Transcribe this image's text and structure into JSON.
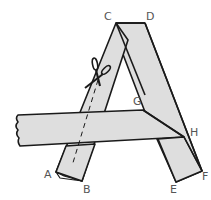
{
  "diagram": {
    "colors": {
      "fill": "#dedede",
      "stroke": "#1a1a1a",
      "label": "#555555",
      "background": "#ffffff"
    },
    "labels": {
      "C": "C",
      "D": "D",
      "G": "G",
      "H": "H",
      "A": "A",
      "B": "B",
      "E": "E",
      "F": "F"
    },
    "icons": {
      "scissors": "scissors-icon"
    }
  }
}
